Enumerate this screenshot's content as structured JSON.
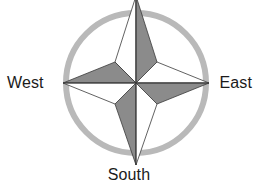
{
  "figure": {
    "kind": "compass-rose",
    "background_color": "#ffffff",
    "width": 258,
    "height": 186
  },
  "colors": {
    "ring": "#b9b9b9",
    "star_shaded": "#8b8b8b",
    "star_light": "#ffffff",
    "outline": "#3a3a3a",
    "label_text": "#1b1b1b"
  },
  "ring": {
    "center_x": 136,
    "center_y": 83,
    "radius": 70,
    "stroke_width": 6
  },
  "star": {
    "center_x": 136,
    "center_y": 83,
    "tip_north_y": -4,
    "tip_south_y": 165,
    "tip_west_x": 63,
    "tip_east_x": 209,
    "waist_radius": 21,
    "points": [
      {
        "name": "north",
        "left_half": "light",
        "right_half": "shaded"
      },
      {
        "name": "east",
        "top_half": "light",
        "bottom_half": "shaded"
      },
      {
        "name": "south",
        "left_half": "shaded",
        "right_half": "light"
      },
      {
        "name": "west",
        "top_half": "shaded",
        "bottom_half": "light"
      }
    ]
  },
  "labels": {
    "west": "West",
    "east": "East",
    "south": "South"
  }
}
